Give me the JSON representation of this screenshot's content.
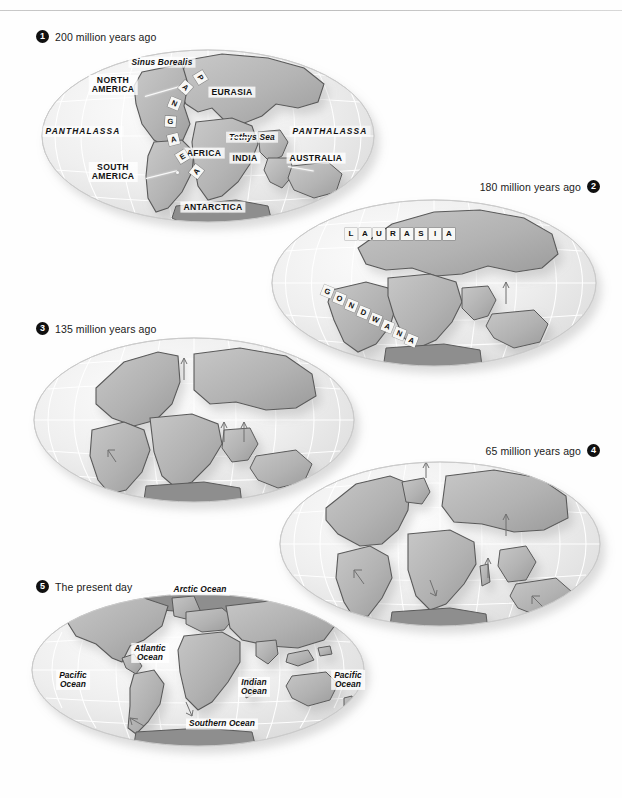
{
  "figure": {
    "panel_count": 5
  },
  "captions": [
    {
      "number": "1",
      "text": "200 million years ago",
      "align": "left"
    },
    {
      "number": "2",
      "text": "180 million years ago",
      "align": "right"
    },
    {
      "number": "3",
      "text": "135 million years ago",
      "align": "left"
    },
    {
      "number": "4",
      "text": "65 million years ago",
      "align": "right"
    },
    {
      "number": "5",
      "text": "The present day",
      "align": "left"
    }
  ],
  "panel1_labels": {
    "sinus_borealis": "Sinus Borealis",
    "north_america": "NORTH\nAMERICA",
    "north_america_l1": "NORTH",
    "north_america_l2": "AMERICA",
    "south_america_l1": "SOUTH",
    "south_america_l2": "AMERICA",
    "eurasia": "EURASIA",
    "africa": "AFRICA",
    "india": "INDIA",
    "australia": "AUSTRALIA",
    "antarctica": "ANTARCTICA",
    "tethys_sea": "Tethys Sea",
    "panthalassa_west": "PANTHALASSA",
    "panthalassa_east": "PANTHALASSA",
    "pangaea": "PANGAEA"
  },
  "panel2_labels": {
    "laurasia": "LAURASIA",
    "gondwana": "GONDWANA"
  },
  "panel5_labels": {
    "arctic_ocean": "Arctic Ocean",
    "atlantic_ocean_l1": "Atlantic",
    "atlantic_ocean_l2": "Ocean",
    "pacific_ocean_west_l1": "Pacific",
    "pacific_ocean_west_l2": "Ocean",
    "pacific_ocean_east_l1": "Pacific",
    "pacific_ocean_east_l2": "Ocean",
    "indian_ocean_l1": "Indian",
    "indian_ocean_l2": "Ocean",
    "southern_ocean": "Southern Ocean"
  },
  "colors": {
    "background": "#ffffff",
    "ocean_light": "#f2f2f2",
    "ocean_mid": "#e4e4e4",
    "land_light": "#d7d7d7",
    "land_mid": "#b9b9b9",
    "land_dark": "#9a9a9a",
    "graticule": "#ffffff",
    "outline": "#4a4a4a",
    "text": "#111111",
    "bullet": "#101010",
    "rule": "#c9c9c9"
  }
}
